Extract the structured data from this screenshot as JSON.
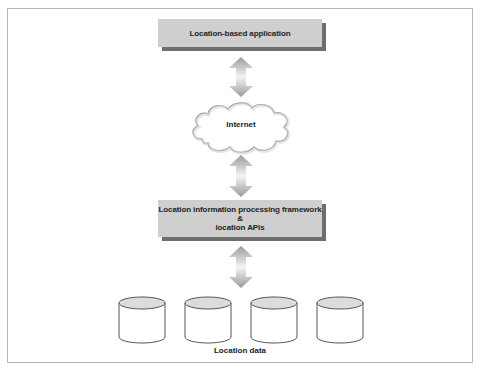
{
  "diagram": {
    "top_box": {
      "label": "Location-based application"
    },
    "cloud": {
      "label": "Internet"
    },
    "middle_box": {
      "line1": "Location information processing framework",
      "line2": "&",
      "line3": "location APIs"
    },
    "datastores": {
      "count": 4,
      "caption": "Location data"
    },
    "colors": {
      "box_fill": "#cfcfcf",
      "box_shadow": "#6e6e6e",
      "arrow": "#a8a8a8",
      "cylinder_top": "#dcdcdc",
      "outline": "#555555"
    }
  }
}
